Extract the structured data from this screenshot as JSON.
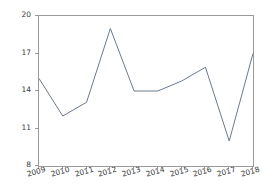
{
  "chart_data": {
    "type": "line",
    "title": "",
    "subtitle": "",
    "xlabel": "",
    "ylabel": "",
    "categories": [
      "2009",
      "2010",
      "2011",
      "2012",
      "2013",
      "2014",
      "2015",
      "2016",
      "2017",
      "2018"
    ],
    "values": [
      15.0,
      12.0,
      13.1,
      19.0,
      14.0,
      14.0,
      14.8,
      15.9,
      10.0,
      17.0
    ],
    "series": [
      {
        "name": "series-1",
        "values": [
          15.0,
          12.0,
          13.1,
          19.0,
          14.0,
          14.0,
          14.8,
          15.9,
          10.0,
          17.0
        ],
        "color": "#6b7a8a"
      }
    ],
    "ylim": [
      8,
      20
    ],
    "yticks": [
      8,
      11,
      14,
      17,
      20
    ],
    "ytick_labels": [
      "8",
      "11",
      "14",
      "17",
      "20"
    ],
    "xticks": [
      "2009",
      "2010",
      "2011",
      "2012",
      "2013",
      "2014",
      "2015",
      "2016",
      "2017",
      "2018"
    ],
    "xtick_rotation": -16,
    "grid": false,
    "legend": false,
    "legend_position": "none",
    "markers": false,
    "line_color": "#6b7a8a",
    "line_width": 1,
    "axes_frame_color": "#9a9a9a",
    "background_color": "#ffffff",
    "tick_label_color": "#3a3a3a",
    "annotations": []
  }
}
